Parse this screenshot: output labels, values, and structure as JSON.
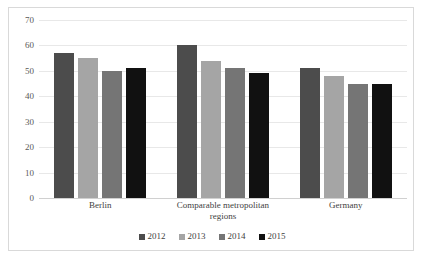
{
  "chart_data": {
    "type": "bar",
    "title": "",
    "subtitle": "",
    "xlabel": "",
    "ylabel": "",
    "categories": [
      "Berlin",
      "Comparable metropolitan regions",
      "Germany"
    ],
    "category_lines": [
      [
        "Berlin"
      ],
      [
        "Comparable metropolitan",
        "regions"
      ],
      [
        "Germany"
      ]
    ],
    "series": [
      {
        "name": "2012",
        "color": "#4c4c4c",
        "values": [
          57,
          60,
          51
        ]
      },
      {
        "name": "2013",
        "color": "#a5a5a5",
        "values": [
          55,
          54,
          48
        ]
      },
      {
        "name": "2014",
        "color": "#757575",
        "values": [
          50,
          51,
          45
        ]
      },
      {
        "name": "2015",
        "color": "#111111",
        "values": [
          51,
          49,
          45
        ]
      }
    ],
    "ylim": [
      0,
      70
    ],
    "ytick_step": 10,
    "yticks": [
      "0",
      "10",
      "20",
      "30",
      "40",
      "50",
      "60",
      "70"
    ],
    "grid": true,
    "legend_position": "bottom",
    "bar_border_color": "#ffffff",
    "gridline_color": "#e8e8e8",
    "frame_color": "#d9d9d9",
    "background": "#ffffff"
  }
}
